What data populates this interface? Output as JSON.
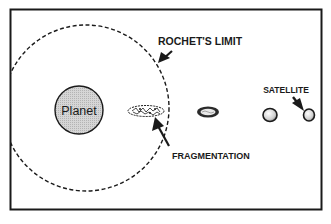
{
  "diagram": {
    "labels": {
      "roche_limit": "ROCHET'S LIMIT",
      "planet": "Planet",
      "fragmentation": "FRAGMENTATION",
      "satellite": "SATELLITE"
    },
    "colors": {
      "frame": "#1a1a1a",
      "background": "#ffffff",
      "planet_fill": "#c8c8c8",
      "ink": "#1a1a1a"
    },
    "elements": [
      "frame",
      "roche-limit-dashed-circle",
      "planet",
      "fragmenting-satellite",
      "stretched-satellite",
      "satellite-intact",
      "satellite-approaching"
    ]
  }
}
